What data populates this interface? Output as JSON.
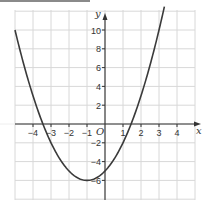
{
  "chart_data": {
    "type": "line",
    "title": "",
    "xlabel": "x",
    "ylabel": "y",
    "origin_label": "O",
    "function": "y = x^2 + 2x - 5",
    "xlim": [
      -5,
      5
    ],
    "ylim": [
      -7,
      11
    ],
    "grid": true,
    "x_ticks": [
      -4,
      -3,
      -2,
      -1,
      1,
      2,
      3,
      4
    ],
    "x_tick_labels": [
      "−4",
      "−3",
      "−2",
      "−1",
      "1",
      "2",
      "3",
      "4"
    ],
    "y_ticks": [
      -6,
      -4,
      -2,
      2,
      4,
      6,
      8,
      10
    ],
    "y_tick_labels": [
      "−6",
      "−4",
      "−2",
      "2",
      "4",
      "6",
      "8",
      "10"
    ],
    "series": [
      {
        "name": "parabola",
        "x": [
          -5,
          -4.5,
          -4,
          -3.5,
          -3,
          -2.5,
          -2,
          -1.5,
          -1,
          -0.5,
          0,
          0.5,
          1,
          1.5,
          2,
          2.5,
          3,
          3.3
        ],
        "y": [
          10,
          6.25,
          3,
          0.25,
          -2,
          -3.75,
          -5,
          -5.75,
          -6,
          -5.75,
          -5,
          -3.75,
          -2,
          0.25,
          3,
          6.25,
          10,
          12.49
        ]
      }
    ],
    "colors": {
      "curve": "#3a3a3a",
      "grid": "#d8d8d8",
      "axis": "#333333"
    }
  }
}
